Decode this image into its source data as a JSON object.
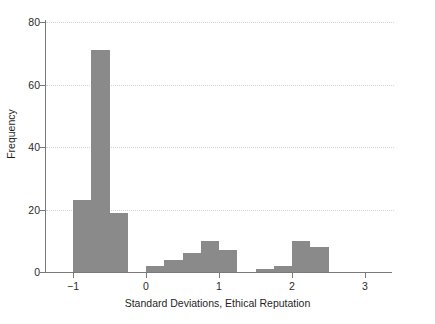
{
  "chart_data": {
    "type": "bar",
    "title": "",
    "xlabel": "Standard Deviations, Ethical Reputation",
    "ylabel": "Frequency",
    "xlim": [
      -1.25,
      3.0
    ],
    "ylim": [
      0,
      80
    ],
    "xticks": [
      -1,
      0,
      1,
      2,
      3
    ],
    "xtick_labels": [
      "−1",
      "0",
      "1",
      "2",
      "3"
    ],
    "yticks": [
      0,
      20,
      40,
      60,
      80
    ],
    "ytick_labels": [
      "0",
      "20",
      "40",
      "60",
      "80"
    ],
    "grid": "horizontal-dotted",
    "legend": "none",
    "bar_color": "#8a8a8a",
    "bin_width": 0.25,
    "bin_edges": [
      -1.0,
      -0.75,
      -0.5,
      -0.25,
      0.0,
      0.25,
      0.5,
      0.75,
      1.0,
      1.25,
      1.5,
      1.75,
      2.0,
      2.25,
      2.5
    ],
    "bins": [
      {
        "x0": -1.0,
        "x1": -0.75,
        "value": 23
      },
      {
        "x0": -0.75,
        "x1": -0.5,
        "value": 71
      },
      {
        "x0": -0.5,
        "x1": -0.25,
        "value": 19
      },
      {
        "x0": -0.25,
        "x1": 0.0,
        "value": 0
      },
      {
        "x0": 0.0,
        "x1": 0.25,
        "value": 2
      },
      {
        "x0": 0.25,
        "x1": 0.5,
        "value": 4
      },
      {
        "x0": 0.5,
        "x1": 0.75,
        "value": 6
      },
      {
        "x0": 0.75,
        "x1": 1.0,
        "value": 10
      },
      {
        "x0": 1.0,
        "x1": 1.25,
        "value": 7
      },
      {
        "x0": 1.25,
        "x1": 1.5,
        "value": 0
      },
      {
        "x0": 1.5,
        "x1": 1.75,
        "value": 1
      },
      {
        "x0": 1.75,
        "x1": 2.0,
        "value": 2
      },
      {
        "x0": 2.0,
        "x1": 2.25,
        "value": 10
      },
      {
        "x0": 2.25,
        "x1": 2.5,
        "value": 8
      }
    ],
    "categories": [
      "-1.0",
      "-0.75",
      "-0.5",
      "-0.25",
      "0.0",
      "0.25",
      "0.5",
      "0.75",
      "1.0",
      "1.25",
      "1.5",
      "1.75",
      "2.0",
      "2.25"
    ],
    "values": [
      23,
      71,
      19,
      0,
      2,
      4,
      6,
      10,
      7,
      0,
      1,
      2,
      10,
      8
    ]
  }
}
